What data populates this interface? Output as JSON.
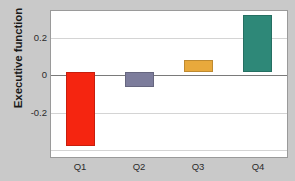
{
  "chart_data": {
    "type": "bar",
    "title": "",
    "xlabel": "",
    "ylabel": "Executive function",
    "categories": [
      "Q1",
      "Q2",
      "Q3",
      "Q4"
    ],
    "values": [
      -0.42,
      -0.085,
      0.07,
      0.32
    ],
    "series": [
      {
        "name": "Executive function",
        "values": [
          -0.42,
          -0.085,
          0.07,
          0.32
        ]
      }
    ],
    "bar_colors": [
      "#f52510",
      "#7d7d9c",
      "#e8a93c",
      "#2e8878"
    ],
    "ylim": [
      -0.48,
      0.345
    ],
    "yticks": [
      0.2,
      0,
      -0.2
    ],
    "ytick_labels": [
      "0.2",
      "0",
      "-0.2"
    ],
    "grid": true,
    "legend": "none",
    "zero_line": true,
    "figure_background": "#c9c9c9",
    "plot_background": "#ffffff",
    "grid_color": "#d4d4d4",
    "axis_color": "#9a9a9a"
  }
}
